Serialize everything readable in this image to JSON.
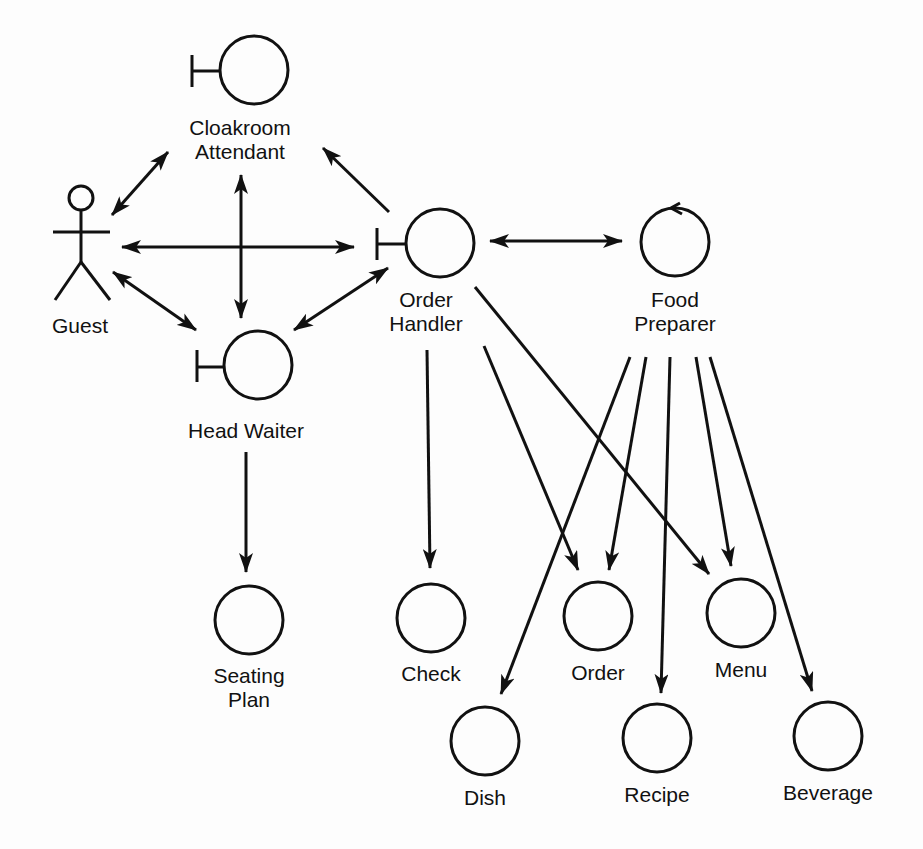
{
  "diagram": {
    "type": "UML robustness / analysis object diagram",
    "colors": {
      "stroke": "#111111",
      "background": "#fdfdfd"
    },
    "nodes": [
      {
        "id": "guest",
        "kind": "actor",
        "label": [
          "Guest"
        ]
      },
      {
        "id": "cloakroom_attendant",
        "kind": "boundary",
        "label": [
          "Cloakroom",
          "Attendant"
        ]
      },
      {
        "id": "head_waiter",
        "kind": "boundary",
        "label": [
          "Head Waiter"
        ]
      },
      {
        "id": "order_handler",
        "kind": "boundary",
        "label": [
          "Order",
          "Handler"
        ]
      },
      {
        "id": "food_preparer",
        "kind": "control",
        "label": [
          "Food",
          "Preparer"
        ]
      },
      {
        "id": "seating_plan",
        "kind": "entity",
        "label": [
          "Seating",
          "Plan"
        ]
      },
      {
        "id": "check",
        "kind": "entity",
        "label": [
          "Check"
        ]
      },
      {
        "id": "order",
        "kind": "entity",
        "label": [
          "Order"
        ]
      },
      {
        "id": "menu",
        "kind": "entity",
        "label": [
          "Menu"
        ]
      },
      {
        "id": "dish",
        "kind": "entity",
        "label": [
          "Dish"
        ]
      },
      {
        "id": "recipe",
        "kind": "entity",
        "label": [
          "Recipe"
        ]
      },
      {
        "id": "beverage",
        "kind": "entity",
        "label": [
          "Beverage"
        ]
      }
    ],
    "edges": [
      {
        "from": "guest",
        "to": "cloakroom_attendant",
        "direction": "both"
      },
      {
        "from": "guest",
        "to": "order_handler",
        "direction": "both"
      },
      {
        "from": "guest",
        "to": "head_waiter",
        "direction": "both"
      },
      {
        "from": "cloakroom_attendant",
        "to": "head_waiter",
        "direction": "both"
      },
      {
        "from": "order_handler",
        "to": "cloakroom_attendant",
        "direction": "forward"
      },
      {
        "from": "head_waiter",
        "to": "order_handler",
        "direction": "both"
      },
      {
        "from": "order_handler",
        "to": "food_preparer",
        "direction": "both"
      },
      {
        "from": "head_waiter",
        "to": "seating_plan",
        "direction": "forward"
      },
      {
        "from": "order_handler",
        "to": "check",
        "direction": "forward"
      },
      {
        "from": "order_handler",
        "to": "order",
        "direction": "forward"
      },
      {
        "from": "order_handler",
        "to": "menu",
        "direction": "forward"
      },
      {
        "from": "food_preparer",
        "to": "dish",
        "direction": "forward"
      },
      {
        "from": "food_preparer",
        "to": "order",
        "direction": "forward"
      },
      {
        "from": "food_preparer",
        "to": "recipe",
        "direction": "forward"
      },
      {
        "from": "food_preparer",
        "to": "menu",
        "direction": "forward"
      },
      {
        "from": "food_preparer",
        "to": "beverage",
        "direction": "forward"
      }
    ]
  }
}
